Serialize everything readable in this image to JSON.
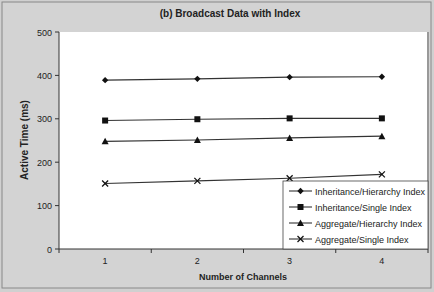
{
  "chart_data": {
    "type": "line",
    "title": "(b) Broadcast Data with Index",
    "xlabel": "Number of Channels",
    "ylabel": "Active Time (ms)",
    "categories": [
      "1",
      "2",
      "3",
      "4"
    ],
    "ylim": [
      0,
      500
    ],
    "yticks": [
      0,
      100,
      200,
      300,
      400,
      500
    ],
    "grid": false,
    "legend_position": "lower right (inside plot)",
    "series": [
      {
        "name": "Inheritance/Hierarchy Index",
        "marker": "diamond",
        "values": [
          389,
          392,
          396,
          397
        ]
      },
      {
        "name": "Inheritance/Single Index",
        "marker": "square",
        "values": [
          296,
          299,
          301,
          301
        ]
      },
      {
        "name": "Aggregate/Hierarchy Index",
        "marker": "triangle",
        "values": [
          248,
          251,
          256,
          260
        ]
      },
      {
        "name": "Aggregate/Single Index",
        "marker": "x",
        "values": [
          151,
          157,
          163,
          172
        ]
      }
    ]
  }
}
